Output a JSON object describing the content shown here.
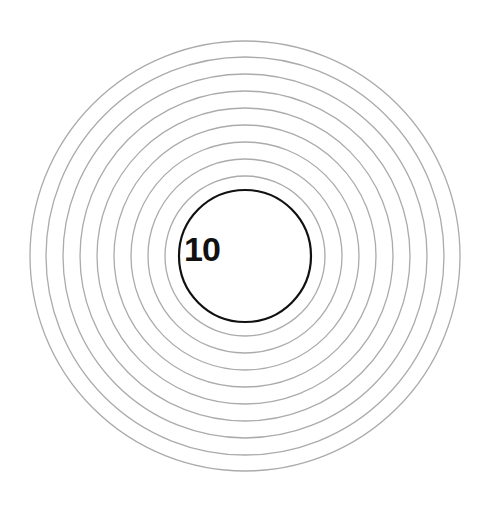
{
  "target": {
    "center": {
      "x": 245,
      "y": 256
    },
    "inner_circle": {
      "label": "10",
      "radius": 66,
      "stroke_color": "#111111"
    },
    "rings": {
      "count": 9,
      "radii": [
        80,
        97,
        114,
        131,
        148,
        165,
        182,
        199,
        215
      ],
      "stroke_color": "#ababab"
    },
    "background_color": "#ffffff"
  }
}
